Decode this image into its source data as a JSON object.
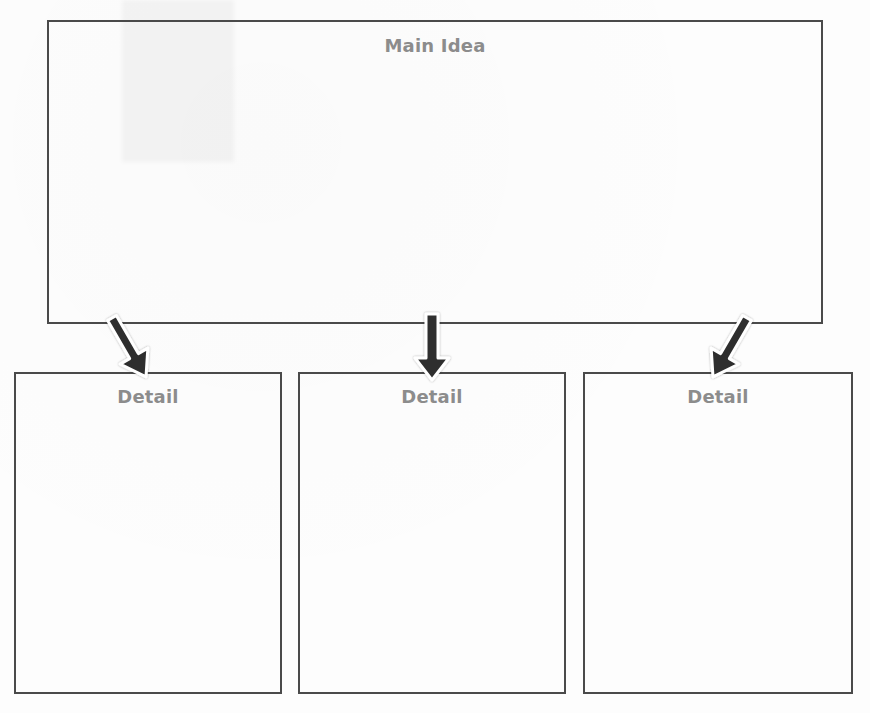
{
  "diagram": {
    "type": "main-idea-and-details graphic organizer",
    "main_idea": {
      "label": "Main Idea"
    },
    "details": [
      {
        "label": "Detail"
      },
      {
        "label": "Detail"
      },
      {
        "label": "Detail"
      }
    ],
    "colors": {
      "border": "#4a4a4a",
      "label_text": "#8c8c8c",
      "arrow_fill": "#2f2f2f",
      "arrow_outline": "#ffffff",
      "background": "#fdfdfd"
    },
    "arrows": [
      {
        "from": "main-idea",
        "to": "detail-1",
        "direction": "down-right"
      },
      {
        "from": "main-idea",
        "to": "detail-2",
        "direction": "down"
      },
      {
        "from": "main-idea",
        "to": "detail-3",
        "direction": "down-left"
      }
    ]
  }
}
